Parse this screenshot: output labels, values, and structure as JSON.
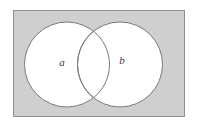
{
  "figure": {
    "type": "venn-diagram",
    "title": "",
    "caption": "",
    "canvas": {
      "width": 198,
      "height": 127,
      "background": "#ffffff"
    },
    "universe_rect": {
      "name": "universal-set",
      "label": "",
      "x": 13,
      "y": 10,
      "width": 172,
      "height": 107,
      "fill": "#cfcfcf",
      "stroke": "#8f8f8f",
      "stroke_width": 1
    },
    "sets": [
      {
        "id": "a",
        "label": "a",
        "cx": 67,
        "cy": 64.5,
        "r": 42.5,
        "fill": "#ffffff",
        "stroke": "#7a7a7a",
        "stroke_width": 1,
        "label_x": 62,
        "label_y": 66
      },
      {
        "id": "b",
        "label": "b",
        "cx": 120,
        "cy": 64.5,
        "r": 42.5,
        "fill": "#ffffff",
        "stroke": "#7a7a7a",
        "stroke_width": 1,
        "label_x": 122,
        "label_y": 64
      }
    ],
    "intersection": {
      "name": "a-intersect-b",
      "label": "",
      "fill": "#ffffff",
      "shaded": false
    },
    "colors": {
      "universe_fill": "#cfcfcf",
      "set_fill": "#ffffff",
      "outline": "#7a7a7a",
      "label_text": "#3a3a3a",
      "page_background": "#ffffff"
    }
  }
}
